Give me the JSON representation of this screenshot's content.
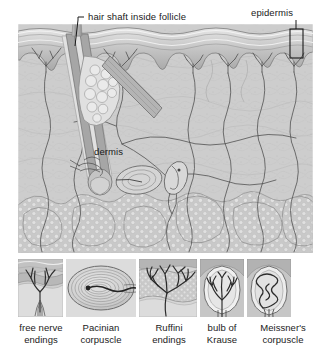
{
  "figure": {
    "type": "anatomical-cross-section-illustration",
    "style": "grayscale halftone line drawing",
    "background_color": "#ffffff",
    "palette": {
      "paper": "#ffffff",
      "skin_light": "#d9d9d9",
      "skin_mid": "#bdbdbd",
      "skin_dark": "#9a9a9a",
      "ink": "#3a3a3a",
      "label_text": "#1a1a1a",
      "fat_fill": "#cfcfcf",
      "hair_shaft": "#b0b0b0"
    }
  },
  "main_diagram": {
    "name": "skin-cross-section",
    "bounds": {
      "x": 18,
      "y": 24,
      "width": 295,
      "height": 229
    },
    "layers": [
      {
        "name": "epidermis",
        "label": "epidermis"
      },
      {
        "name": "dermis",
        "label": "dermis"
      },
      {
        "name": "hypodermis",
        "label": ""
      }
    ],
    "labels": {
      "hair_shaft": "hair shaft inside follicle",
      "epidermis": "epidermis",
      "dermis": "dermis"
    },
    "leader_lines": [
      {
        "from_label": "hair shaft inside follicle",
        "points": "84,17 78,17 74,46"
      },
      {
        "from_label": "epidermis",
        "points": "296,20 296,29"
      }
    ],
    "epidermis_bracket": {
      "x": 290,
      "y": 29,
      "width": 13,
      "height": 29
    }
  },
  "receptor_panels": [
    {
      "id": "free-nerve-endings",
      "caption_line1": "free nerve",
      "caption_line2": "endings",
      "box": {
        "x": 18,
        "y": 259,
        "width": 45,
        "height": 58
      }
    },
    {
      "id": "pacinian-corpuscle",
      "caption_line1": "Pacinian",
      "caption_line2": "corpuscle",
      "box": {
        "x": 66,
        "y": 259,
        "width": 70,
        "height": 58
      }
    },
    {
      "id": "ruffini-endings",
      "caption_line1": "Ruffini",
      "caption_line2": "endings",
      "box": {
        "x": 139,
        "y": 259,
        "width": 58,
        "height": 58
      }
    },
    {
      "id": "bulb-of-krause",
      "caption_line1": "bulb of",
      "caption_line2": "Krause",
      "box": {
        "x": 200,
        "y": 259,
        "width": 44,
        "height": 58
      }
    },
    {
      "id": "meissners-corpuscle",
      "caption_line1": "Meissner's",
      "caption_line2": "corpuscle",
      "box": {
        "x": 247,
        "y": 259,
        "width": 44,
        "height": 58
      }
    }
  ]
}
